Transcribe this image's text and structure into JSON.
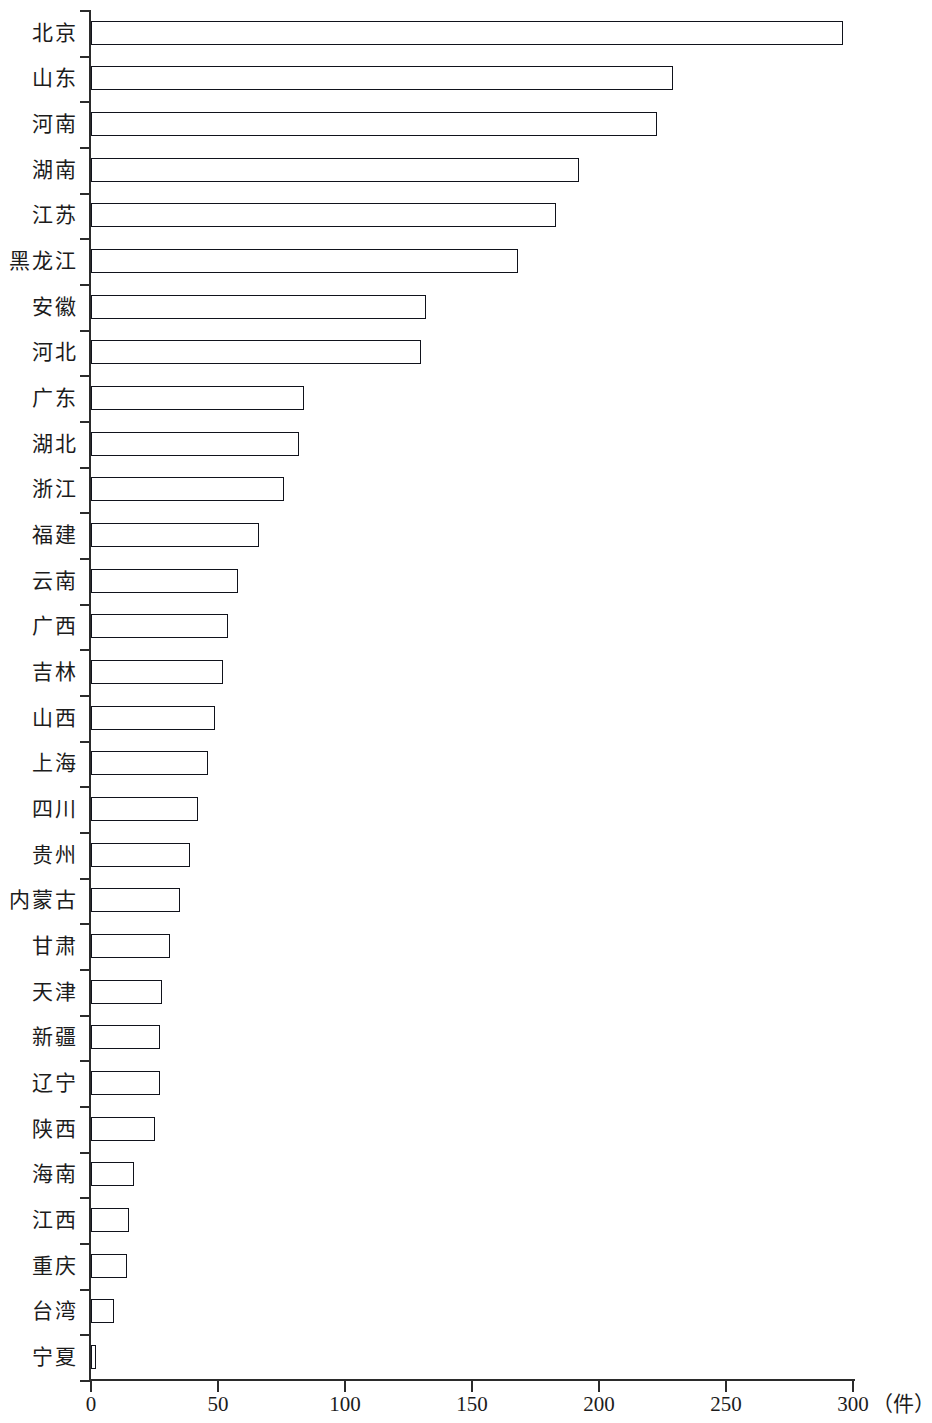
{
  "chart_data": {
    "type": "bar",
    "orientation": "horizontal",
    "title": "",
    "subtitle": "",
    "xlabel": "（件）",
    "ylabel": "",
    "xlim": [
      0,
      300
    ],
    "xticks": [
      0,
      50,
      100,
      150,
      200,
      250,
      300
    ],
    "xtick_labels": [
      "0",
      "50",
      "100",
      "150",
      "200",
      "250",
      "300"
    ],
    "grid": false,
    "legend": null,
    "legend_position": "none",
    "categories": [
      "北京",
      "山东",
      "河南",
      "湖南",
      "江苏",
      "黑龙江",
      "安徽",
      "河北",
      "广东",
      "湖北",
      "浙江",
      "福建",
      "云南",
      "广西",
      "吉林",
      "山西",
      "上海",
      "四川",
      "贵州",
      "内蒙古",
      "甘肃",
      "天津",
      "新疆",
      "辽宁",
      "陕西",
      "海南",
      "江西",
      "重庆",
      "台湾",
      "宁夏"
    ],
    "values": [
      296,
      229,
      223,
      192,
      183,
      168,
      132,
      130,
      84,
      82,
      76,
      66,
      58,
      54,
      52,
      49,
      46,
      42,
      39,
      35,
      31,
      28,
      27,
      27,
      25,
      17,
      15,
      14,
      9,
      2
    ],
    "series": [
      {
        "name": "件数",
        "values": [
          296,
          229,
          223,
          192,
          183,
          168,
          132,
          130,
          84,
          82,
          76,
          66,
          58,
          54,
          52,
          49,
          46,
          42,
          39,
          35,
          31,
          28,
          27,
          27,
          25,
          17,
          15,
          14,
          9,
          2
        ]
      }
    ],
    "colors": {
      "bar_edge": "#11131c",
      "bar_light": "#f7f9fc",
      "bar_dark": "#2a3145",
      "axis": "#2b2b2b",
      "text": "#1c1c1c",
      "background": "#ffffff"
    }
  }
}
